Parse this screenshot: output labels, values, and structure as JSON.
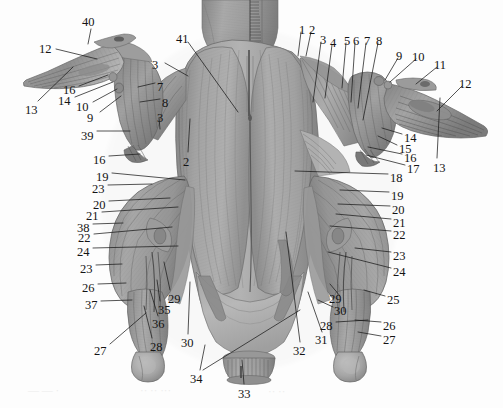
{
  "figure": {
    "view": "ventral",
    "style": "grayscale engraved anatomical plate",
    "background_color": "#fdfdfd",
    "ink_color": "#141414",
    "label_count": 41
  },
  "labels": [
    {
      "id": "l-40",
      "text": "40",
      "x": 82,
      "y": 16
    },
    {
      "id": "l-12a",
      "text": "12",
      "x": 39,
      "y": 43
    },
    {
      "id": "l-16a",
      "text": "16",
      "x": 63,
      "y": 84
    },
    {
      "id": "l-14a",
      "text": "14",
      "x": 58,
      "y": 95
    },
    {
      "id": "l-10a",
      "text": "10",
      "x": 76,
      "y": 101
    },
    {
      "id": "l-9a",
      "text": "9",
      "x": 87,
      "y": 112
    },
    {
      "id": "l-13a",
      "text": "13",
      "x": 25,
      "y": 104
    },
    {
      "id": "l-7a",
      "text": "7",
      "x": 157,
      "y": 81
    },
    {
      "id": "l-8a",
      "text": "8",
      "x": 162,
      "y": 97
    },
    {
      "id": "l-3b",
      "text": "3",
      "x": 157,
      "y": 112
    },
    {
      "id": "l-39",
      "text": "39",
      "x": 81,
      "y": 130
    },
    {
      "id": "l-16b",
      "text": "16",
      "x": 93,
      "y": 154
    },
    {
      "id": "l-41",
      "text": "41",
      "x": 176,
      "y": 33
    },
    {
      "id": "l-3a",
      "text": "3",
      "x": 152,
      "y": 59
    },
    {
      "id": "l-2a",
      "text": "2",
      "x": 183,
      "y": 156
    },
    {
      "id": "l-1",
      "text": "1",
      "x": 299,
      "y": 24
    },
    {
      "id": "l-2b",
      "text": "2",
      "x": 309,
      "y": 24
    },
    {
      "id": "l-3c",
      "text": "3",
      "x": 320,
      "y": 34
    },
    {
      "id": "l-4",
      "text": "4",
      "x": 330,
      "y": 37
    },
    {
      "id": "l-5",
      "text": "5",
      "x": 344,
      "y": 35
    },
    {
      "id": "l-6",
      "text": "6",
      "x": 353,
      "y": 35
    },
    {
      "id": "l-7b",
      "text": "7",
      "x": 364,
      "y": 35
    },
    {
      "id": "l-8b",
      "text": "8",
      "x": 376,
      "y": 35
    },
    {
      "id": "l-9b",
      "text": "9",
      "x": 396,
      "y": 50
    },
    {
      "id": "l-10b",
      "text": "10",
      "x": 412,
      "y": 51
    },
    {
      "id": "l-11",
      "text": "11",
      "x": 434,
      "y": 59
    },
    {
      "id": "l-12b",
      "text": "12",
      "x": 459,
      "y": 78
    },
    {
      "id": "l-14b",
      "text": "14",
      "x": 404,
      "y": 132
    },
    {
      "id": "l-15",
      "text": "15",
      "x": 399,
      "y": 143
    },
    {
      "id": "l-16c",
      "text": "16",
      "x": 404,
      "y": 152
    },
    {
      "id": "l-17",
      "text": "17",
      "x": 407,
      "y": 163
    },
    {
      "id": "l-13b",
      "text": "13",
      "x": 433,
      "y": 162
    },
    {
      "id": "l-18",
      "text": "18",
      "x": 390,
      "y": 172
    },
    {
      "id": "l-19b",
      "text": "19",
      "x": 391,
      "y": 190
    },
    {
      "id": "l-20b",
      "text": "20",
      "x": 392,
      "y": 204
    },
    {
      "id": "l-21b",
      "text": "21",
      "x": 393,
      "y": 217
    },
    {
      "id": "l-22b",
      "text": "22",
      "x": 393,
      "y": 229
    },
    {
      "id": "l-23c",
      "text": "23",
      "x": 393,
      "y": 250
    },
    {
      "id": "l-24b",
      "text": "24",
      "x": 393,
      "y": 266
    },
    {
      "id": "l-25",
      "text": "25",
      "x": 387,
      "y": 294
    },
    {
      "id": "l-26b",
      "text": "26",
      "x": 383,
      "y": 320
    },
    {
      "id": "l-27b",
      "text": "27",
      "x": 383,
      "y": 334
    },
    {
      "id": "l-28b",
      "text": "28",
      "x": 320,
      "y": 320
    },
    {
      "id": "l-29b",
      "text": "29",
      "x": 329,
      "y": 293
    },
    {
      "id": "l-30b",
      "text": "30",
      "x": 334,
      "y": 305
    },
    {
      "id": "l-31",
      "text": "31",
      "x": 315,
      "y": 334
    },
    {
      "id": "l-32",
      "text": "32",
      "x": 293,
      "y": 345
    },
    {
      "id": "l-33",
      "text": "33",
      "x": 238,
      "y": 388
    },
    {
      "id": "l-34",
      "text": "34",
      "x": 190,
      "y": 373
    },
    {
      "id": "l-30a",
      "text": "30",
      "x": 181,
      "y": 337
    },
    {
      "id": "l-19a",
      "text": "19",
      "x": 96,
      "y": 171
    },
    {
      "id": "l-23a",
      "text": "23",
      "x": 92,
      "y": 183
    },
    {
      "id": "l-20a",
      "text": "20",
      "x": 93,
      "y": 199
    },
    {
      "id": "l-21a",
      "text": "21",
      "x": 86,
      "y": 210
    },
    {
      "id": "l-38",
      "text": "38",
      "x": 77,
      "y": 222
    },
    {
      "id": "l-22a",
      "text": "22",
      "x": 78,
      "y": 232
    },
    {
      "id": "l-24a",
      "text": "24",
      "x": 77,
      "y": 246
    },
    {
      "id": "l-23b",
      "text": "23",
      "x": 80,
      "y": 263
    },
    {
      "id": "l-26a",
      "text": "26",
      "x": 82,
      "y": 282
    },
    {
      "id": "l-37",
      "text": "37",
      "x": 85,
      "y": 299
    },
    {
      "id": "l-29a",
      "text": "29",
      "x": 168,
      "y": 293
    },
    {
      "id": "l-35",
      "text": "35",
      "x": 158,
      "y": 304
    },
    {
      "id": "l-36",
      "text": "36",
      "x": 152,
      "y": 318
    },
    {
      "id": "l-27a",
      "text": "27",
      "x": 94,
      "y": 345
    },
    {
      "id": "l-28a",
      "text": "28",
      "x": 150,
      "y": 341
    }
  ],
  "leader_lines": [
    {
      "id": "ld-40",
      "from": [
        91,
        29
      ],
      "to": [
        88,
        44
      ]
    },
    {
      "id": "ld-12a",
      "from": [
        56,
        49
      ],
      "to": [
        97,
        59
      ]
    },
    {
      "id": "ld-13a",
      "from": [
        38,
        101
      ],
      "to": [
        73,
        67
      ]
    },
    {
      "id": "ld-16a",
      "from": [
        79,
        86
      ],
      "to": [
        108,
        75
      ]
    },
    {
      "id": "ld-14a",
      "from": [
        75,
        97
      ],
      "to": [
        113,
        82
      ]
    },
    {
      "id": "ld-10a",
      "from": [
        93,
        102
      ],
      "to": [
        117,
        89
      ]
    },
    {
      "id": "ld-9a",
      "from": [
        100,
        112
      ],
      "to": [
        121,
        96
      ]
    },
    {
      "id": "ld-7a",
      "from": [
        155,
        83
      ],
      "to": [
        138,
        87
      ]
    },
    {
      "id": "ld-8a",
      "from": [
        160,
        99
      ],
      "to": [
        140,
        102
      ]
    },
    {
      "id": "ld-3b",
      "from": [
        159,
        118
      ],
      "to": [
        160,
        129
      ]
    },
    {
      "id": "ld-39",
      "from": [
        97,
        131
      ],
      "to": [
        130,
        131
      ]
    },
    {
      "id": "ld-16b",
      "from": [
        109,
        156
      ],
      "to": [
        140,
        154
      ]
    },
    {
      "id": "ld-41",
      "from": [
        188,
        42
      ],
      "to": [
        238,
        112
      ]
    },
    {
      "id": "ld-3a",
      "from": [
        165,
        63
      ],
      "to": [
        188,
        76
      ]
    },
    {
      "id": "ld-2a",
      "from": [
        188,
        152
      ],
      "to": [
        190,
        119
      ]
    },
    {
      "id": "ld-1",
      "from": [
        301,
        32
      ],
      "to": [
        298,
        56
      ]
    },
    {
      "id": "ld-2b",
      "from": [
        311,
        32
      ],
      "to": [
        306,
        56
      ]
    },
    {
      "id": "ld-3c",
      "from": [
        321,
        42
      ],
      "to": [
        313,
        102
      ]
    },
    {
      "id": "ld-4",
      "from": [
        332,
        45
      ],
      "to": [
        325,
        98
      ]
    },
    {
      "id": "ld-5",
      "from": [
        346,
        43
      ],
      "to": [
        342,
        88
      ]
    },
    {
      "id": "ld-6",
      "from": [
        355,
        43
      ],
      "to": [
        351,
        102
      ]
    },
    {
      "id": "ld-7b",
      "from": [
        366,
        43
      ],
      "to": [
        358,
        108
      ]
    },
    {
      "id": "ld-8b",
      "from": [
        378,
        43
      ],
      "to": [
        363,
        120
      ]
    },
    {
      "id": "ld-9b",
      "from": [
        398,
        58
      ],
      "to": [
        385,
        80
      ]
    },
    {
      "id": "ld-10b",
      "from": [
        416,
        59
      ],
      "to": [
        390,
        82
      ]
    },
    {
      "id": "ld-11",
      "from": [
        437,
        67
      ],
      "to": [
        416,
        84
      ]
    },
    {
      "id": "ld-12b",
      "from": [
        462,
        86
      ],
      "to": [
        437,
        111
      ]
    },
    {
      "id": "ld-13b",
      "from": [
        437,
        158
      ],
      "to": [
        440,
        98
      ]
    },
    {
      "id": "ld-14b",
      "from": [
        402,
        134
      ],
      "to": [
        382,
        128
      ]
    },
    {
      "id": "ld-15",
      "from": [
        397,
        145
      ],
      "to": [
        378,
        136
      ]
    },
    {
      "id": "ld-16c",
      "from": [
        402,
        154
      ],
      "to": [
        368,
        147
      ]
    },
    {
      "id": "ld-17",
      "from": [
        405,
        165
      ],
      "to": [
        366,
        155
      ]
    },
    {
      "id": "ld-18",
      "from": [
        388,
        174
      ],
      "to": [
        295,
        171
      ]
    },
    {
      "id": "ld-19b",
      "from": [
        389,
        192
      ],
      "to": [
        340,
        190
      ]
    },
    {
      "id": "ld-20b",
      "from": [
        390,
        206
      ],
      "to": [
        338,
        204
      ]
    },
    {
      "id": "ld-21b",
      "from": [
        391,
        219
      ],
      "to": [
        336,
        214
      ]
    },
    {
      "id": "ld-22b",
      "from": [
        391,
        231
      ],
      "to": [
        330,
        226
      ]
    },
    {
      "id": "ld-23c",
      "from": [
        391,
        252
      ],
      "to": [
        355,
        248
      ]
    },
    {
      "id": "ld-24b",
      "from": [
        391,
        268
      ],
      "to": [
        328,
        252
      ]
    },
    {
      "id": "ld-25",
      "from": [
        385,
        296
      ],
      "to": [
        364,
        290
      ]
    },
    {
      "id": "ld-26b",
      "from": [
        381,
        322
      ],
      "to": [
        355,
        320
      ]
    },
    {
      "id": "ld-27b",
      "from": [
        381,
        336
      ],
      "to": [
        358,
        332
      ]
    },
    {
      "id": "ld-28b",
      "from": [
        336,
        322
      ],
      "to": [
        368,
        320
      ]
    },
    {
      "id": "ld-29a2",
      "from": [
        340,
        296
      ],
      "to": [
        330,
        284
      ]
    },
    {
      "id": "ld-30b",
      "from": [
        333,
        307
      ],
      "to": [
        318,
        300
      ]
    },
    {
      "id": "ld-31",
      "from": [
        322,
        332
      ],
      "to": [
        308,
        292
      ]
    },
    {
      "id": "ld-32",
      "from": [
        300,
        342
      ],
      "to": [
        286,
        232
      ]
    },
    {
      "id": "ld-33",
      "from": [
        244,
        384
      ],
      "to": [
        242,
        360
      ]
    },
    {
      "id": "ld-34a",
      "from": [
        200,
        370
      ],
      "to": [
        205,
        345
      ]
    },
    {
      "id": "ld-34b",
      "from": [
        203,
        370
      ],
      "to": [
        300,
        310
      ]
    },
    {
      "id": "ld-30a",
      "from": [
        188,
        334
      ],
      "to": [
        190,
        282
      ]
    },
    {
      "id": "ld-19a",
      "from": [
        112,
        173
      ],
      "to": [
        185,
        180
      ]
    },
    {
      "id": "ld-23a",
      "from": [
        108,
        185
      ],
      "to": [
        152,
        184
      ]
    },
    {
      "id": "ld-20a",
      "from": [
        109,
        201
      ],
      "to": [
        170,
        198
      ]
    },
    {
      "id": "ld-21a",
      "from": [
        102,
        212
      ],
      "to": [
        178,
        207
      ]
    },
    {
      "id": "ld-38",
      "from": [
        93,
        224
      ],
      "to": [
        123,
        223
      ]
    },
    {
      "id": "ld-22a",
      "from": [
        94,
        234
      ],
      "to": [
        172,
        227
      ]
    },
    {
      "id": "ld-24a",
      "from": [
        93,
        248
      ],
      "to": [
        178,
        246
      ]
    },
    {
      "id": "ld-23b",
      "from": [
        96,
        265
      ],
      "to": [
        122,
        264
      ]
    },
    {
      "id": "ld-26a",
      "from": [
        98,
        284
      ],
      "to": [
        126,
        283
      ]
    },
    {
      "id": "ld-37",
      "from": [
        101,
        301
      ],
      "to": [
        132,
        300
      ]
    },
    {
      "id": "ld-29a",
      "from": [
        170,
        290
      ],
      "to": [
        164,
        262
      ]
    },
    {
      "id": "ld-35",
      "from": [
        160,
        301
      ],
      "to": [
        157,
        280
      ]
    },
    {
      "id": "ld-36",
      "from": [
        158,
        316
      ],
      "to": [
        150,
        290
      ]
    },
    {
      "id": "ld-27a",
      "from": [
        110,
        344
      ],
      "to": [
        146,
        313
      ]
    },
    {
      "id": "ld-28a",
      "from": [
        152,
        338
      ],
      "to": [
        144,
        306
      ]
    }
  ],
  "artifacts": [
    {
      "id": "ar-1",
      "text": "—  —    ·",
      "x": 28,
      "y": 384
    },
    {
      "id": "ar-2",
      "text": "··   ··   ···",
      "x": 140,
      "y": 384
    },
    {
      "id": "ar-3",
      "text": "··  ··",
      "x": 268,
      "y": 385
    }
  ]
}
